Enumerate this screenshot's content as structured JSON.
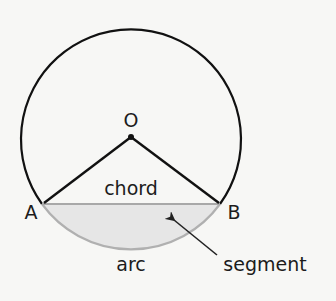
{
  "diagram": {
    "labels": {
      "center": "O",
      "point_a": "A",
      "point_b": "B",
      "chord": "chord",
      "arc": "arc",
      "segment": "segment"
    },
    "colors": {
      "background": "#f7f7f5",
      "circle_stroke": "#111111",
      "radius_stroke": "#111111",
      "chord_stroke": "#a8a8a8",
      "arc_stroke": "#b0b0b0",
      "segment_fill": "#e6e6e6",
      "arrow": "#222222",
      "text": "#1c1c1c"
    }
  }
}
